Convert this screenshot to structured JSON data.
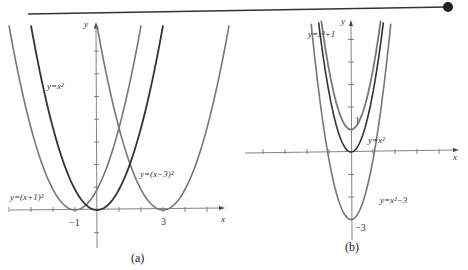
{
  "header_line": {
    "color": "#333333",
    "dot_color": "#222222"
  },
  "panel_a": {
    "caption": "(a)",
    "x_axis_label": "x",
    "y_axis_label": "y",
    "tick_labels": {
      "neg1": "−1",
      "three": "3"
    },
    "curves": [
      {
        "label": "y=x²",
        "h": 0,
        "k": 0,
        "color": "#333333"
      },
      {
        "label": "y=(x+1)²",
        "h": -1,
        "k": 0,
        "color": "#777777"
      },
      {
        "label": "y=(x−3)²",
        "h": 3,
        "k": 0,
        "color": "#777777"
      }
    ]
  },
  "panel_b": {
    "caption": "(b)",
    "x_axis_label": "x",
    "y_axis_label": "y",
    "tick_labels": {
      "one": "1",
      "neg3": "−3"
    },
    "curves": [
      {
        "label": "y=x²+1",
        "h": 0,
        "k": 1,
        "color": "#777777"
      },
      {
        "label": "y=x²",
        "h": 0,
        "k": 0,
        "color": "#333333"
      },
      {
        "label": "y=x²−3",
        "h": 0,
        "k": -3,
        "color": "#777777"
      }
    ]
  },
  "chart_data": [
    {
      "type": "line",
      "title": "(a)",
      "xlabel": "x",
      "ylabel": "y",
      "series": [
        {
          "name": "y=x^2",
          "formula": "x^2",
          "vertex": [
            0,
            0
          ]
        },
        {
          "name": "y=(x+1)^2",
          "formula": "(x+1)^2",
          "vertex": [
            -1,
            0
          ]
        },
        {
          "name": "y=(x-3)^2",
          "formula": "(x-3)^2",
          "vertex": [
            3,
            0
          ]
        }
      ],
      "x_ticks_labeled": [
        -1,
        3
      ],
      "xlim": [
        -4.3,
        5.3
      ],
      "ylim": [
        -2,
        9
      ]
    },
    {
      "type": "line",
      "title": "(b)",
      "xlabel": "x",
      "ylabel": "y",
      "series": [
        {
          "name": "y=x^2+1",
          "formula": "x^2+1",
          "vertex": [
            0,
            1
          ]
        },
        {
          "name": "y=x^2",
          "formula": "x^2",
          "vertex": [
            0,
            0
          ]
        },
        {
          "name": "y=x^2-3",
          "formula": "x^2-3",
          "vertex": [
            0,
            -3
          ]
        }
      ],
      "y_ticks_labeled": [
        1,
        -3
      ],
      "xlim": [
        -5,
        6
      ],
      "ylim": [
        -4,
        6.5
      ]
    }
  ]
}
